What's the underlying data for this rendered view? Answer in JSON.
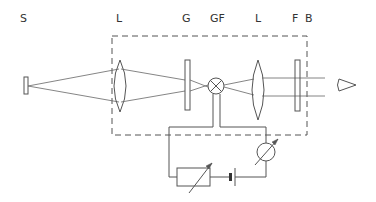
{
  "diagram": {
    "type": "optical-setup schematic",
    "labels": {
      "source": "S",
      "lens1": "L",
      "grating": "G",
      "lamp": "GF",
      "lens2": "L",
      "filter": "F",
      "observer": "B"
    },
    "components": [
      {
        "id": "source",
        "label": "S",
        "symbol": "rectangle-source"
      },
      {
        "id": "lens1",
        "label": "L",
        "symbol": "biconvex-lens"
      },
      {
        "id": "grating",
        "label": "G",
        "symbol": "plate"
      },
      {
        "id": "lamp",
        "label": "GF",
        "symbol": "lamp-crossed-circle"
      },
      {
        "id": "lens2",
        "label": "L",
        "symbol": "biconvex-lens"
      },
      {
        "id": "filter",
        "label": "F",
        "symbol": "plate"
      },
      {
        "id": "observer",
        "label": "B",
        "symbol": "eye"
      },
      {
        "id": "variable-resistor",
        "symbol": "rheostat"
      },
      {
        "id": "battery",
        "symbol": "battery-cell"
      },
      {
        "id": "ammeter",
        "symbol": "adjustable-meter"
      }
    ],
    "enclosure": "dashed-box"
  }
}
